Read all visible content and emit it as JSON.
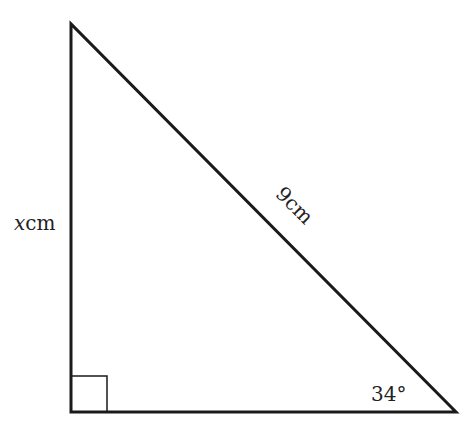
{
  "diagram": {
    "type": "right-triangle",
    "labels": {
      "vertical_side_var": "x",
      "vertical_side_unit": "cm",
      "hypotenuse": "9cm",
      "angle": "34°"
    },
    "colors": {
      "stroke": "#1a1a1a",
      "text": "#222222",
      "background": "#ffffff"
    },
    "vertices": {
      "top": [
        71,
        24
      ],
      "bottom_left": [
        71,
        412
      ],
      "bottom_right": [
        456,
        412
      ]
    },
    "right_angle_marker_size": 36
  }
}
